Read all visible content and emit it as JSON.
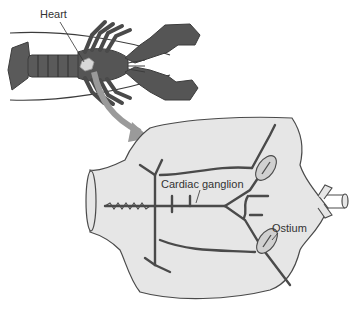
{
  "labels": {
    "heart": "Heart",
    "cardiac_ganglion": "Cardiac ganglion",
    "ostium": "Ostium"
  },
  "colors": {
    "lobster_body": "#5a5a5a",
    "lobster_dark": "#3c3c3c",
    "heart_fill": "#d8d8d8",
    "heart_chamber_fill": "#e6e6e6",
    "nerve_fill": "#bdbdbd",
    "outline": "#4a4a4a",
    "arrow": "#9a9a9a",
    "text": "#333333"
  }
}
